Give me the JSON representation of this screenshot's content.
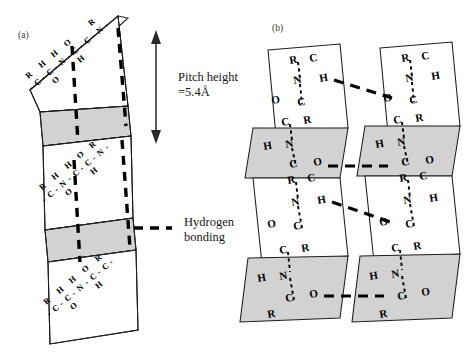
{
  "figure": {
    "panels": [
      {
        "id": "a",
        "tag": "(a)",
        "description": "edge-on pleated sheet single chain"
      },
      {
        "id": "b",
        "tag": "(b)",
        "description": "two parallel pleated chains with interchain hydrogen bonds"
      }
    ]
  },
  "annotations": {
    "pitch": {
      "line1": "Pitch height",
      "line2": "=5.4Å",
      "arrow_name": "double-headed-vertical-arrow"
    },
    "legend": {
      "label_line1": "Hydrogen",
      "label_line2": "bonding",
      "swatch_name": "dashed-line-swatch"
    }
  },
  "panel_a": {
    "strands": [
      {
        "row": 0,
        "sequence": [
          "R",
          "H",
          "H",
          "O",
          "R"
        ],
        "backbone": [
          "-",
          "C",
          "-",
          "C",
          "-",
          "N",
          "-",
          "C",
          "-",
          "C",
          "-",
          "N",
          "-"
        ],
        "sub_lower": [
          "-",
          "O",
          "H"
        ]
      },
      {
        "row": 1,
        "sequence": [
          "R",
          "H",
          "H",
          "O",
          "R"
        ],
        "backbone": [
          "-",
          "C",
          "-",
          "N",
          "-",
          "C",
          "-",
          "C",
          "-",
          "N",
          "-"
        ],
        "sub_lower": [
          "O",
          "H"
        ]
      },
      {
        "row": 2,
        "sequence": [
          "R",
          "H",
          "H",
          "O",
          "R"
        ],
        "backbone": [
          "-",
          "C",
          "-",
          "C",
          "-",
          "N",
          "-",
          "C",
          "-",
          "C",
          "-"
        ],
        "sub_lower": [
          "-",
          "O",
          "H"
        ]
      }
    ],
    "hydrogen_bond_count": 4
  },
  "panel_b": {
    "chains": [
      {
        "id": "left",
        "plane_count": 4
      },
      {
        "id": "right",
        "plane_count": 4
      }
    ],
    "plane_units": [
      {
        "index": 0,
        "shade": "white",
        "atoms": [
          "R",
          "C",
          "N",
          "H",
          "O",
          "C"
        ]
      },
      {
        "index": 1,
        "shade": "gray",
        "atoms": [
          "C",
          "R",
          "H",
          "N",
          "C",
          "O"
        ]
      },
      {
        "index": 2,
        "shade": "white",
        "atoms": [
          "R",
          "C",
          "N",
          "H",
          "O",
          "C"
        ]
      },
      {
        "index": 3,
        "shade": "gray",
        "atoms": [
          "C",
          "R",
          "H",
          "N",
          "C",
          "O"
        ]
      }
    ],
    "interchain_hbond_count": 3
  },
  "colors": {
    "face_up": "#ffffff",
    "face_down": "#d2d2d2",
    "stroke": "#1d1d1d",
    "bond": "#000000",
    "text": "#161616"
  }
}
